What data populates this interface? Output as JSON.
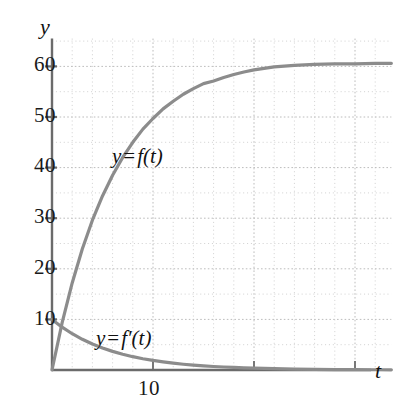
{
  "chart_data": {
    "type": "line",
    "title": "",
    "xlabel": "t",
    "ylabel": "y",
    "xlim": [
      0,
      33.6
    ],
    "ylim": [
      0,
      65.5
    ],
    "grid": true,
    "grid_style": "dotted",
    "x_ticks": [
      10,
      20,
      30
    ],
    "x_tick_labels": [
      "10",
      "",
      ""
    ],
    "y_ticks": [
      10,
      20,
      30,
      40,
      50,
      60
    ],
    "y_tick_labels": [
      "10",
      "20",
      "30",
      "40",
      "50",
      "60"
    ],
    "minor_grid_x_step": 2,
    "minor_grid_y_step": 5,
    "legend": "inline-annotations",
    "series": [
      {
        "name": "y = f(t)",
        "color": "#8c8c8c",
        "formula": "60(1 - e^(-t/6))",
        "x": [
          0,
          1,
          2,
          3,
          4,
          5,
          6,
          7,
          8,
          9,
          10,
          11,
          12,
          13,
          14,
          15,
          16,
          17,
          18,
          19,
          20,
          22,
          24,
          26,
          28,
          30,
          32,
          33.6
        ],
        "y": [
          0,
          9.3,
          17.2,
          23.9,
          29.6,
          34.4,
          38.5,
          42.0,
          45.0,
          47.6,
          49.7,
          51.6,
          53.1,
          54.5,
          55.6,
          56.6,
          57.1,
          57.8,
          58.4,
          58.9,
          59.3,
          59.9,
          60.2,
          60.4,
          60.5,
          60.5,
          60.6,
          60.6
        ]
      },
      {
        "name": "y = f'(t)",
        "color": "#8c8c8c",
        "formula": "10 e^(-t/6)",
        "x": [
          0,
          1,
          2,
          3,
          4,
          5,
          6,
          7,
          8,
          9,
          10,
          11,
          12,
          13,
          14,
          15,
          16,
          17,
          18,
          19,
          20,
          22,
          24,
          26,
          28,
          30,
          32,
          33.6
        ],
        "y": [
          10.0,
          8.46,
          7.17,
          6.07,
          5.13,
          4.35,
          3.68,
          3.12,
          2.63,
          2.23,
          1.89,
          1.6,
          1.35,
          1.14,
          0.97,
          0.82,
          0.69,
          0.59,
          0.5,
          0.42,
          0.36,
          0.26,
          0.18,
          0.13,
          0.09,
          0.07,
          0.05,
          0.04
        ]
      }
    ],
    "annotations": [
      {
        "id": "label-f",
        "text_y": "y",
        "text_eq": "=",
        "text_fn": "f(t)",
        "x": 7.2,
        "y": 43.0
      },
      {
        "id": "label-f-prime",
        "text_y": "y",
        "text_eq": "=",
        "text_fn": "f′(t)",
        "x": 4.8,
        "y": 8.6
      }
    ],
    "axis_color": "#6b6b6b",
    "grid_color": "#c9c9c9",
    "text_color": "#1a1a1a"
  }
}
